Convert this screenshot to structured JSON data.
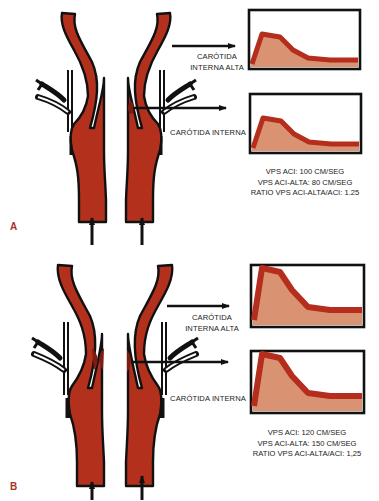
{
  "colors": {
    "vessel": "#b3301d",
    "vessel_outline": "#111111",
    "stenosis": "#7e1c12",
    "wave_fill": "#d99372",
    "wave_stroke": "#b52d1c",
    "panel_letter": "#a8322a"
  },
  "panels": [
    {
      "id": "A",
      "letter": "A",
      "labels": {
        "high_ica_line1": "CARÓTIDA",
        "high_ica_line2": "INTERNA ALTA",
        "ica": "CARÓTIDA INTERNA"
      },
      "stats": {
        "line1": "VPS ACI: 100 CM/SEG",
        "line2": "VPS ACI-ALTA: 80 CM/SEG",
        "line3": "RATIO VPS ACI-ALTA/ACI: 1.25"
      },
      "waveforms": [
        {
          "label": "CARÓTIDA INTERNA ALTA",
          "peak_relative": 0.72
        },
        {
          "label": "CARÓTIDA INTERNA",
          "peak_relative": 0.72
        }
      ]
    },
    {
      "id": "B",
      "letter": "B",
      "labels": {
        "high_ica_line1": "CARÓTIDA",
        "high_ica_line2": "INTERNA ALTA",
        "ica": "CARÓTIDA INTERNA"
      },
      "stats": {
        "line1": "VPS ACI: 120  CM/SEG",
        "line2": "VPS ACI-ALTA: 150  CM/SEG",
        "line3": "RATIO  VPS ACI-ALTA/ACI: 1,25"
      },
      "waveforms": [
        {
          "label": "CARÓTIDA INTERNA ALTA",
          "peak_relative": 0.95
        },
        {
          "label": "CARÓTIDA INTERNA",
          "peak_relative": 0.95
        }
      ]
    }
  ]
}
